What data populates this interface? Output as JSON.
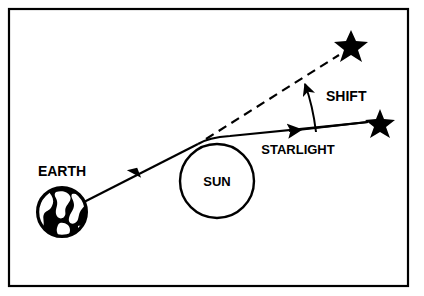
{
  "figure": {
    "kind": "diagram",
    "title_visible": false,
    "background_color": "#ffffff",
    "ink_color": "#000000",
    "border": {
      "name": "figure-border",
      "shown": true,
      "x": 9,
      "y": 9,
      "width": 399,
      "height": 277,
      "stroke_width": 2,
      "color": "#000000"
    }
  },
  "labels": {
    "earth": "EARTH",
    "sun": "SUN",
    "shift": "SHIFT",
    "starlight": "STARLIGHT"
  },
  "objects": {
    "earth": {
      "name": "earth-globe",
      "cx": 62,
      "cy": 212,
      "r": 25,
      "fill": "#000000",
      "label_x": 62,
      "label_y": 176
    },
    "sun": {
      "name": "sun-circle",
      "cx": 217,
      "cy": 181,
      "r": 37,
      "fill": "#ffffff",
      "stroke": "#000000",
      "stroke_width": 2.5,
      "label_x": 217,
      "label_y": 186
    },
    "star_apparent": {
      "name": "star-apparent-position",
      "cx": 351,
      "cy": 45,
      "r": 15,
      "fill": "#000000"
    },
    "star_true": {
      "name": "star-true-position",
      "cx": 380,
      "cy": 123,
      "r": 14,
      "fill": "#000000"
    }
  },
  "paths": {
    "starlight_solid": {
      "name": "starlight-deflected-path",
      "style": "solid",
      "stroke_width": 2.2,
      "description": "Light travels from true star position leftward, bends around the top of the Sun, and continues to Earth."
    },
    "apparent_dashed": {
      "name": "apparent-direction-dashed-line",
      "style": "dashed",
      "dash_pattern": "9 6",
      "stroke_width": 2.2,
      "description": "Dashed line of sight from the bend point to the apparent star position."
    },
    "shift_arc": {
      "name": "shift-angle-arc",
      "style": "solid-curved-arrow",
      "stroke_width": 2.0,
      "description": "Curved arrow measuring the angular shift between the true and apparent starlight directions."
    }
  },
  "label_positions": {
    "shift": {
      "x": 326,
      "y": 100,
      "anchor": "start"
    },
    "starlight": {
      "x": 298,
      "y": 153,
      "anchor": "middle"
    }
  }
}
